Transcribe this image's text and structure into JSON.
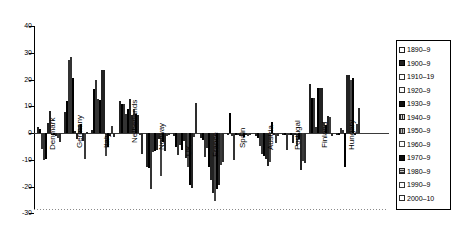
{
  "chart_data": {
    "type": "bar",
    "title": "",
    "xlabel": "",
    "ylabel": "",
    "ylim": [
      -30,
      40
    ],
    "ytick_values": [
      40,
      30,
      20,
      10,
      0,
      -10,
      -20,
      -30
    ],
    "ytick_labels": [
      "40",
      "30",
      "20",
      "10",
      "0",
      "-10",
      "-20",
      "-30"
    ],
    "grid": false,
    "legend_position": "right",
    "categories": [
      "Denmark",
      "Germany",
      "Italy",
      "Netherlands",
      "Norway",
      "UK",
      "France",
      "Spain",
      "Austria",
      "Portugal",
      "Finland",
      "Hungary"
    ],
    "series": [
      {
        "name": "1890–9",
        "values": [
          2.2,
          7.8,
          1.2,
          11.8,
          -12.8,
          -1.2,
          -2.0,
          -0.6,
          -1.0,
          -0.4,
          18.4,
          -0.8
        ]
      },
      {
        "name": "1900–9",
        "values": [
          1.5,
          11.8,
          16.6,
          11.0,
          -13.0,
          -5.2,
          -2.8,
          7.3,
          -1.8,
          -0.5,
          13.2,
          -0.6
        ]
      },
      {
        "name": "1910–19",
        "values": [
          -6.0,
          27.3,
          20.0,
          10.8,
          -20.8,
          -8.4,
          -9.0,
          -1.0,
          -5.0,
          -6.3,
          13.2,
          1.8
        ]
      },
      {
        "name": "1920–9",
        "values": [
          -10.2,
          28.4,
          12.8,
          7.2,
          -7.0,
          -4.4,
          -5.6,
          -10.2,
          -7.8,
          -0.3,
          2.4,
          1.0
        ]
      },
      {
        "name": "1930–9",
        "values": [
          -9.8,
          20.6,
          12.4,
          9.0,
          -6.6,
          -6.2,
          -12.6,
          -0.4,
          -8.6,
          -0.6,
          17.0,
          -12.6
        ]
      },
      {
        "name": "1940–9",
        "values": [
          3.6,
          0.9,
          23.4,
          12.8,
          -6.2,
          -3.0,
          -17.4,
          -0.7,
          -9.6,
          -3.8,
          16.8,
          21.8
        ]
      },
      {
        "name": "1950–9",
        "values": [
          8.1,
          -2.4,
          23.7,
          6.8,
          -2.2,
          -9.2,
          -22.4,
          -1.0,
          -12.2,
          -0.8,
          17.0,
          21.6
        ]
      },
      {
        "name": "1960–9",
        "values": [
          -0.4,
          3.0,
          -8.6,
          9.1,
          -16.0,
          -12.8,
          -25.5,
          -1.2,
          -10.8,
          -5.0,
          3.6,
          19.8
        ]
      },
      {
        "name": "1970–9",
        "values": [
          -0.6,
          3.4,
          -5.2,
          7.0,
          -3.2,
          -19.6,
          -21.0,
          -1.4,
          4.2,
          -2.2,
          3.1,
          20.6
        ]
      },
      {
        "name": "1980–9",
        "values": [
          -1.2,
          -3.0,
          -1.2,
          6.6,
          -6.8,
          -20.5,
          -19.4,
          -0.6,
          -0.8,
          -13.8,
          6.3,
          -0.4
        ]
      },
      {
        "name": "1990–9",
        "values": [
          -2.0,
          -9.6,
          2.6,
          -0.8,
          -1.2,
          -1.4,
          -12.0,
          -1.0,
          -3.6,
          -10.6,
          6.0,
          3.2
        ]
      },
      {
        "name": "2000–10",
        "values": [
          -3.2,
          0.4,
          -1.4,
          -8.0,
          -0.8,
          11.4,
          -10.8,
          -0.5,
          -1.0,
          -11.4,
          -1.0,
          9.2
        ]
      }
    ],
    "legend_entries": [
      {
        "label": "1890–9",
        "pattern": "light-hatch"
      },
      {
        "label": "1900–9",
        "pattern": "solid-dark"
      },
      {
        "label": "1910–19",
        "pattern": "white"
      },
      {
        "label": "1920–9",
        "pattern": "white"
      },
      {
        "label": "1930–9",
        "pattern": "solid-black"
      },
      {
        "label": "1940–9",
        "pattern": "vertical-hatch"
      },
      {
        "label": "1950–9",
        "pattern": "vertical-hatch-dense"
      },
      {
        "label": "1960–9",
        "pattern": "white"
      },
      {
        "label": "1970–9",
        "pattern": "solid-black"
      },
      {
        "label": "1980–9",
        "pattern": "horizontal-hatch"
      },
      {
        "label": "1990–9",
        "pattern": "white"
      },
      {
        "label": "2000–10",
        "pattern": "white"
      }
    ]
  }
}
